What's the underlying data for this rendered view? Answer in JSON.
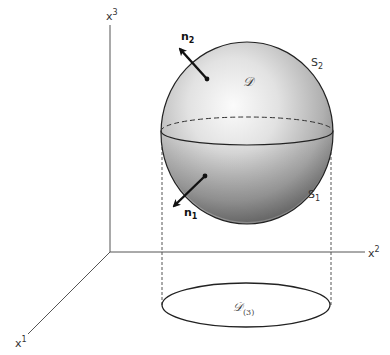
{
  "diagram": {
    "type": "3d-geometry",
    "axes": {
      "x1": {
        "label": "x",
        "superscript": "1"
      },
      "x2": {
        "label": "x",
        "superscript": "2"
      },
      "x3": {
        "label": "x",
        "superscript": "3"
      }
    },
    "region": {
      "label": "𝒟"
    },
    "projection": {
      "label": "𝒟",
      "subscript": "(3)"
    },
    "surfaces": {
      "upper": {
        "label": "S",
        "subscript": "2"
      },
      "lower": {
        "label": "S",
        "subscript": "1"
      }
    },
    "normals": {
      "upper": {
        "label": "n",
        "subscript": "2"
      },
      "lower": {
        "label": "n",
        "subscript": "1"
      }
    },
    "colors": {
      "line": "#222222",
      "sphere_light": "#f4f4f4",
      "sphere_dark": "#6e6e6e",
      "dashed": "#555555"
    }
  }
}
